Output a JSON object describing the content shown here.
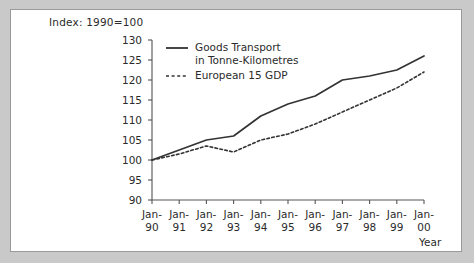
{
  "chart_data": {
    "type": "line",
    "title": "Index: 1990=100",
    "xlabel": "Year",
    "ylabel": "",
    "ylim": [
      90,
      130
    ],
    "yticks": [
      90,
      95,
      100,
      105,
      110,
      115,
      120,
      125,
      130
    ],
    "grid": false,
    "legend_position": "top-left-inside",
    "categories": [
      "Jan-90",
      "Jan-91",
      "Jan-92",
      "Jan-93",
      "Jan-94",
      "Jan-95",
      "Jan-96",
      "Jan-97",
      "Jan-98",
      "Jan-99",
      "Jan-00"
    ],
    "x_tick_lines": [
      [
        "Jan-",
        "90"
      ],
      [
        "Jan-",
        "91"
      ],
      [
        "Jan-",
        "92"
      ],
      [
        "Jan-",
        "93"
      ],
      [
        "Jan-",
        "94"
      ],
      [
        "Jan-",
        "95"
      ],
      [
        "Jan-",
        "96"
      ],
      [
        "Jan-",
        "97"
      ],
      [
        "Jan-",
        "98"
      ],
      [
        "Jan-",
        "99"
      ],
      [
        "Jan-",
        "00"
      ]
    ],
    "series": [
      {
        "name": "Goods Transport in Tonne-Kilometres",
        "name_lines": [
          "Goods Transport",
          "in Tonne-Kilometres"
        ],
        "style": "solid",
        "color": "#333333",
        "values": [
          100,
          102.5,
          105,
          106,
          111,
          114,
          116,
          120,
          121,
          122.5,
          126
        ]
      },
      {
        "name": "European 15 GDP",
        "name_lines": [
          "European 15 GDP"
        ],
        "style": "dashed",
        "color": "#333333",
        "values": [
          100,
          101.5,
          103.5,
          102,
          105,
          106.5,
          109,
          112,
          115,
          118,
          122
        ]
      }
    ]
  },
  "figure": {
    "background_color": "#c9c9c9",
    "panel_color": "#ffffff",
    "border_color": "#9a9a9a",
    "axis_color": "#555555",
    "text_color": "#2b2b2b"
  }
}
